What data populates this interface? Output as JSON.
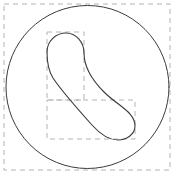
{
  "figure": {
    "canvas": {
      "width": 175,
      "height": 175,
      "background_color": "#ffffff"
    },
    "colors": {
      "outline_stroke": "#3a3a3a",
      "dashed_stroke": "#b4b4b4",
      "background": "#ffffff"
    },
    "strokes": {
      "solid_width": 1.0,
      "dashed_width": 1.0,
      "dash_pattern": "5,4"
    }
  },
  "chart_data": {
    "type": "scatter",
    "xlabel": "",
    "ylabel": "",
    "xlim": [
      0,
      175
    ],
    "ylim": [
      0,
      175
    ],
    "grid": false,
    "legend": "none",
    "shapes": [
      {
        "name": "outer-bounding-box",
        "kind": "rect-dashed",
        "x": 4,
        "y": 4,
        "width": 166,
        "height": 166,
        "stroke": "#b4b4b4"
      },
      {
        "name": "outer-circle",
        "kind": "circle",
        "cx": 87.5,
        "cy": 87,
        "r": 81.5,
        "stroke": "#3a3a3a"
      },
      {
        "name": "bean-upper-bounding-box",
        "kind": "rect-dashed",
        "x": 47,
        "y": 32,
        "width": 37,
        "height": 68,
        "stroke": "#b4b4b4"
      },
      {
        "name": "bean-lower-bounding-box",
        "kind": "rect-dashed",
        "x": 47,
        "y": 100,
        "width": 88,
        "height": 39,
        "stroke": "#b4b4b4"
      },
      {
        "name": "bean-curve",
        "kind": "closed-path",
        "stroke": "#3a3a3a",
        "path": "M 66 33 C 76 33 84 42 84 53 C 84 68 92 80 104 92 C 118 106 135 112 135 126 C 135 134 127 140 118 140 C 108 140 100 134 92 125 C 74 105 61 90 53 78 C 48 70 47 62 47 52 C 47 41 56 33 66 33 Z"
      }
    ]
  }
}
